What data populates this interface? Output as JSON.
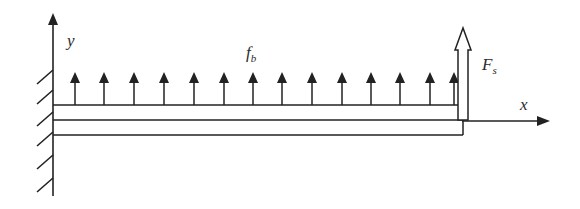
{
  "diagram": {
    "type": "cantilever-beam-free-body",
    "labels": {
      "y_axis": "y",
      "x_axis": "x",
      "distributed_force": "f",
      "distributed_force_sub": "b",
      "point_force": "F",
      "point_force_sub": "s"
    },
    "distributed_arrows_x": [
      75,
      104,
      134,
      164,
      194,
      224,
      253,
      282,
      312,
      342,
      371,
      400,
      430,
      454
    ],
    "colors": {
      "stroke": "#222222",
      "background": "#ffffff"
    }
  }
}
